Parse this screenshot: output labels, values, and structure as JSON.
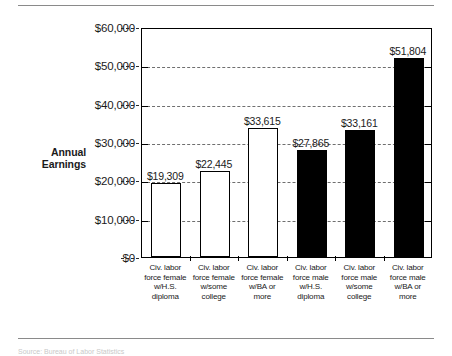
{
  "figure": {
    "axis_title_line1": "Annual",
    "axis_title_line2": "Earnings",
    "footnote": "Source: Bureau of Labor Statistics"
  },
  "chart_data": {
    "type": "bar",
    "title": "",
    "xlabel": "",
    "ylabel": "Annual Earnings",
    "ylim": [
      0,
      60000
    ],
    "ytick_values": [
      0,
      10000,
      20000,
      30000,
      40000,
      50000,
      60000
    ],
    "ytick_labels": [
      "$0",
      "$10,000",
      "$20,000",
      "$30,000",
      "$40,000",
      "$50,000",
      "$60,000"
    ],
    "grid": true,
    "legend": "none",
    "categories": [
      "Civ. labor force female w/H.S. diploma",
      "Civ. labor force female w/some college",
      "Civ. labor force female w/BA or more",
      "Civ. labor force male w/H.S. diploma",
      "Civ. labor force male w/some college",
      "Civ. labor force male w/BA or more"
    ],
    "category_lines": [
      [
        "Civ. labor",
        "force female",
        "w/H.S.",
        "diploma"
      ],
      [
        "Civ. labor",
        "force female",
        "w/some",
        "college"
      ],
      [
        "Civ. labor",
        "force female",
        "w/BA or",
        "more"
      ],
      [
        "Civ. labor",
        "force male",
        "w/H.S.",
        "diploma"
      ],
      [
        "Civ. labor",
        "force male",
        "w/some",
        "college"
      ],
      [
        "Civ. labor",
        "force male",
        "w/BA or",
        "more"
      ]
    ],
    "values": [
      19309,
      22445,
      33615,
      27865,
      33161,
      51804
    ],
    "value_labels": [
      "$19,309",
      "$22,445",
      "$33,615",
      "$27,865",
      "$33,161",
      "$51,804"
    ],
    "bar_styles": [
      "open",
      "open",
      "open",
      "filled",
      "filled",
      "filled"
    ],
    "colors": {
      "bar_open_fill": "#ffffff",
      "bar_filled_fill": "#000000",
      "bar_outline": "#000000",
      "gridline": "#6f6f6f",
      "axis": "#000000",
      "text": "#1a1a1a"
    }
  }
}
